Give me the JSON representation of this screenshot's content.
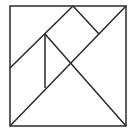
{
  "diagram": {
    "type": "tangram-square",
    "stroke_color": "#2a2a2a",
    "background": "#ffffff",
    "square": {
      "x": 10,
      "y": 6,
      "size": 116
    },
    "lines": [
      {
        "name": "main-diagonal",
        "x1": 10,
        "y1": 126,
        "x2": 126,
        "y2": 6
      },
      {
        "name": "upper-diagonal",
        "x1": 10,
        "y1": 68,
        "x2": 73,
        "y2": 6
      },
      {
        "name": "square-piece-right-edge",
        "x1": 73,
        "y1": 6,
        "x2": 99,
        "y2": 34
      },
      {
        "name": "inner-to-corner-line",
        "x1": 45,
        "y1": 34,
        "x2": 126,
        "y2": 126
      },
      {
        "name": "parallelogram-vertical",
        "x1": 45,
        "y1": 34,
        "x2": 45,
        "y2": 88
      }
    ]
  }
}
